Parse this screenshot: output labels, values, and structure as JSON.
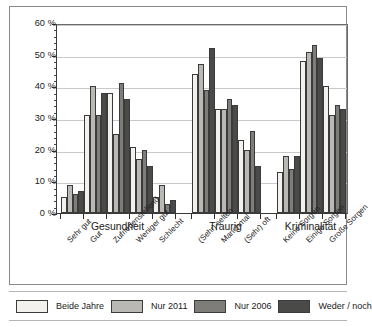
{
  "chart_data": {
    "type": "bar",
    "title": "",
    "xlabel": "",
    "ylabel": "",
    "ylim": [
      0,
      60
    ],
    "ytick_labels": [
      "0 %",
      "10 %",
      "20 %",
      "30 %",
      "40 %",
      "50 %",
      "60 %"
    ],
    "ytick_values": [
      0,
      10,
      20,
      30,
      40,
      50,
      60
    ],
    "grid": true,
    "legend_position": "bottom",
    "categories": [
      "Sehr gut",
      "Gut",
      "Zufriedenstellend",
      "Weniger gut",
      "Schlecht",
      "(Sehr) selten",
      "Manchmal",
      "(Sehr) oft",
      "Keine Sorgen",
      "Einige Sorgen",
      "Große Sorgen"
    ],
    "sections": [
      {
        "label": "Gesundheit",
        "categories": [
          "Sehr gut",
          "Gut",
          "Zufriedenstellend",
          "Weniger gut",
          "Schlecht"
        ]
      },
      {
        "label": "Traurig",
        "categories": [
          "(Sehr) selten",
          "Manchmal",
          "(Sehr) oft"
        ]
      },
      {
        "label": "Kriminalität",
        "categories": [
          "Keine Sorgen",
          "Einige Sorgen",
          "Große Sorgen"
        ]
      }
    ],
    "series": [
      {
        "name": "Beide Jahre",
        "color": "#f2f1ee",
        "values": [
          5,
          31,
          38,
          21,
          5,
          44,
          33,
          23,
          13,
          48,
          40
        ]
      },
      {
        "name": "Nur 2011",
        "color": "#b9b8b4",
        "values": [
          9,
          40,
          25,
          17,
          9,
          47,
          33,
          20,
          18,
          51,
          31
        ]
      },
      {
        "name": "Nur 2006",
        "color": "#7e7d7a",
        "values": [
          6,
          31,
          41,
          20,
          3,
          39,
          36,
          26,
          14,
          53,
          34
        ]
      },
      {
        "name": "Weder / noch",
        "color": "#4a4a48",
        "values": [
          7,
          38,
          36,
          15,
          4,
          52,
          34,
          15,
          18,
          49,
          33
        ]
      }
    ]
  },
  "legend": {
    "items": [
      {
        "label": "Beide Jahre",
        "color": "#f2f1ee"
      },
      {
        "label": "Nur 2011",
        "color": "#b9b8b4"
      },
      {
        "label": "Nur 2006",
        "color": "#7e7d7a"
      },
      {
        "label": "Weder / noch",
        "color": "#4a4a48"
      }
    ]
  }
}
